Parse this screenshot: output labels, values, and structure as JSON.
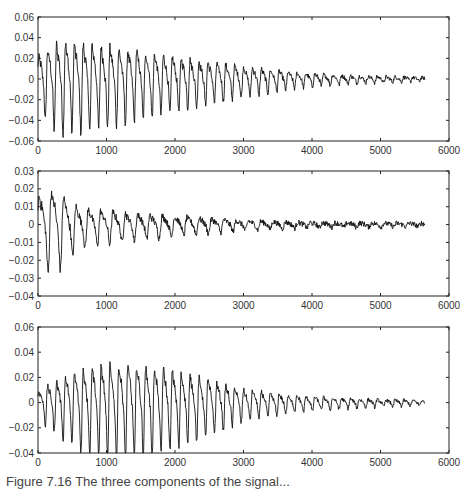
{
  "figure": {
    "caption_partial": "Figure 7.16  The three components of the signal..."
  },
  "chart_data": [
    {
      "type": "line",
      "title": "",
      "xlabel": "",
      "ylabel": "",
      "xlim": [
        0,
        6000
      ],
      "ylim": [
        -0.06,
        0.06
      ],
      "xticks": [
        0,
        1000,
        2000,
        3000,
        4000,
        5000,
        6000
      ],
      "yticks": [
        0.06,
        0.04,
        0.02,
        0,
        -0.02,
        -0.04,
        -0.06
      ],
      "ytick_labels": [
        "0.06",
        "0.04",
        "0.02",
        "0",
        "−0.02",
        "−0.04",
        "−0.06"
      ],
      "grid": false,
      "series": [
        {
          "name": "panel-1",
          "color": "#111111",
          "signal_length": 5650,
          "period": 130,
          "noise": 0.004,
          "envelope": [
            [
              0,
              0.03
            ],
            [
              300,
              0.048
            ],
            [
              800,
              0.045
            ],
            [
              1500,
              0.036
            ],
            [
              2200,
              0.026
            ],
            [
              3000,
              0.016
            ],
            [
              3800,
              0.008
            ],
            [
              4600,
              0.004
            ],
            [
              5650,
              0.002
            ]
          ],
          "description": "oscillation with peak ~0.05 near sample 300, decaying to ~0 by 5650"
        }
      ],
      "box": {
        "left": 38,
        "top": 17,
        "right": 449,
        "bottom": 141
      }
    },
    {
      "type": "line",
      "title": "",
      "xlabel": "",
      "ylabel": "",
      "xlim": [
        0,
        6000
      ],
      "ylim": [
        -0.04,
        0.03
      ],
      "xticks": [
        0,
        1000,
        2000,
        3000,
        4000,
        5000,
        6000
      ],
      "yticks": [
        0.03,
        0.02,
        0.01,
        0,
        -0.01,
        -0.02,
        -0.03,
        -0.04
      ],
      "ytick_labels": [
        "0.03",
        "0.02",
        "0.01",
        "0",
        "−0.01",
        "−0.02",
        "−0.03",
        "−0.04"
      ],
      "grid": false,
      "series": [
        {
          "name": "panel-2",
          "color": "#111111",
          "signal_length": 5650,
          "period": 180,
          "noise": 0.0035,
          "envelope": [
            [
              0,
              0.022
            ],
            [
              250,
              0.026
            ],
            [
              600,
              0.012
            ],
            [
              1200,
              0.009
            ],
            [
              2000,
              0.006
            ],
            [
              3000,
              0.003
            ],
            [
              4000,
              0.0015
            ],
            [
              5650,
              0.001
            ]
          ],
          "description": "noisy oscillation, max ~0.029 near sample 250, min ~-0.03 near 200, settling to ~0"
        }
      ],
      "box": {
        "left": 38,
        "top": 171,
        "right": 449,
        "bottom": 296
      }
    },
    {
      "type": "line",
      "title": "",
      "xlabel": "",
      "ylabel": "",
      "xlim": [
        0,
        6000
      ],
      "ylim": [
        -0.04,
        0.06
      ],
      "xticks": [
        0,
        1000,
        2000,
        3000,
        4000,
        5000,
        6000
      ],
      "yticks": [
        0.06,
        0.04,
        0.02,
        0,
        -0.02,
        -0.04
      ],
      "ytick_labels": [
        "0.06",
        "0.04",
        "0.02",
        "0",
        "−0.02",
        "−0.04"
      ],
      "grid": false,
      "series": [
        {
          "name": "panel-3",
          "color": "#111111",
          "signal_length": 5650,
          "period": 130,
          "noise": 0.003,
          "envelope": [
            [
              0,
              0.012
            ],
            [
              400,
              0.028
            ],
            [
              800,
              0.04
            ],
            [
              1300,
              0.041
            ],
            [
              1800,
              0.037
            ],
            [
              2400,
              0.026
            ],
            [
              3000,
              0.014
            ],
            [
              3800,
              0.007
            ],
            [
              4600,
              0.004
            ],
            [
              5650,
              0.002
            ]
          ],
          "description": "amplitude grows to ~0.04 around 800-1400, then decays to ~0 by 5650"
        }
      ],
      "box": {
        "left": 38,
        "top": 327,
        "right": 449,
        "bottom": 453
      }
    }
  ]
}
